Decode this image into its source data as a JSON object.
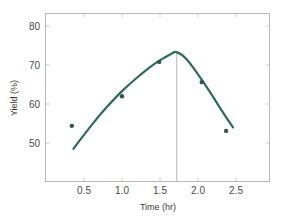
{
  "chart_data": {
    "type": "scatter",
    "title": "",
    "xlabel": "Time (hr)",
    "ylabel": "Yield (%)",
    "xlim": [
      0,
      2.95
    ],
    "ylim": [
      40.4,
      84.2
    ],
    "grid": false,
    "legend": null,
    "x_ticks": [
      0.5,
      1.0,
      1.5,
      2.0,
      2.5
    ],
    "x_tick_labels": [
      "0.5",
      "1.0",
      "1.5",
      "2.0",
      "2.5"
    ],
    "y_ticks": [
      50,
      60,
      70,
      80
    ],
    "y_tick_labels": [
      "50",
      "60",
      "70",
      "80"
    ],
    "series": [
      {
        "name": "Observed yield",
        "kind": "scatter",
        "x": [
          0.34,
          1.0,
          1.49,
          2.05,
          2.37
        ],
        "y": [
          54.4,
          62.0,
          70.8,
          65.6,
          53.1
        ]
      },
      {
        "name": "Fitted curve",
        "kind": "line",
        "x": [
          0.36,
          0.6,
          0.8,
          1.0,
          1.2,
          1.4,
          1.55,
          1.65,
          1.72,
          1.85,
          2.0,
          2.15,
          2.3,
          2.46
        ],
        "y": [
          48.5,
          54.6,
          59.2,
          63.3,
          66.8,
          69.9,
          71.8,
          72.9,
          73.3,
          71.5,
          67.6,
          63.3,
          58.7,
          54.0
        ]
      }
    ],
    "annotations": [
      {
        "type": "vertical_line",
        "x": 1.72,
        "from_y": 73.3,
        "description": "optimum time marker"
      }
    ],
    "colors": {
      "curve": "#2e6b5c",
      "points": "#2e5a4e",
      "axis": "#b0b0b0",
      "marker_line": "#a8a8a8"
    }
  }
}
